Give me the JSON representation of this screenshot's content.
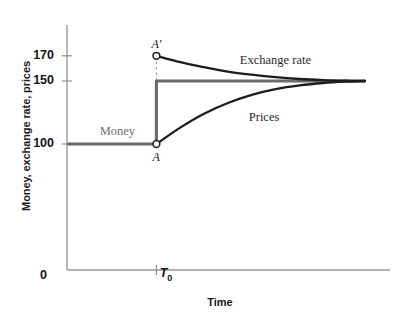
{
  "chart_data": {
    "type": "line",
    "title": "",
    "xlabel": "Time",
    "ylabel": "Money, exchange rate, prices",
    "ylim": [
      0,
      190
    ],
    "xlim": [
      0,
      100
    ],
    "grid": false,
    "legend_position": "inline-annotations",
    "yticks": [
      {
        "value": 170,
        "label": "170"
      },
      {
        "value": 150,
        "label": "150"
      },
      {
        "value": 100,
        "label": "100"
      }
    ],
    "xticks": [
      {
        "value": 0,
        "label": "0"
      },
      {
        "value": 30,
        "label": "T",
        "sublabel": "0"
      }
    ],
    "series": [
      {
        "name": "Money",
        "color": "#6b6b6b",
        "label_text": "Money",
        "description": "Money supply is flat at 100 until T0, then jumps permanently to 150",
        "points": [
          {
            "x": 0,
            "y": 100
          },
          {
            "x": 30,
            "y": 100
          },
          {
            "x": 30,
            "y": 150
          },
          {
            "x": 100,
            "y": 150
          }
        ]
      },
      {
        "name": "Exchange rate",
        "color": "#1c1c1c",
        "label_text": "Exchange rate",
        "description": "Overshoots to 170 at T0 then decays asymptotically down to 150",
        "points": [
          {
            "x": 30,
            "y": 170
          },
          {
            "x": 38,
            "y": 165
          },
          {
            "x": 46,
            "y": 161
          },
          {
            "x": 54,
            "y": 157.5
          },
          {
            "x": 62,
            "y": 155
          },
          {
            "x": 70,
            "y": 153
          },
          {
            "x": 78,
            "y": 151.6
          },
          {
            "x": 86,
            "y": 150.7
          },
          {
            "x": 94,
            "y": 150.2
          },
          {
            "x": 100,
            "y": 150
          }
        ]
      },
      {
        "name": "Prices",
        "color": "#1c1c1c",
        "label_text": "Prices",
        "description": "Sticky at 100 at T0 then rises asymptotically up to 150",
        "points": [
          {
            "x": 30,
            "y": 100
          },
          {
            "x": 38,
            "y": 113
          },
          {
            "x": 46,
            "y": 124
          },
          {
            "x": 54,
            "y": 132.5
          },
          {
            "x": 62,
            "y": 139
          },
          {
            "x": 70,
            "y": 143.5
          },
          {
            "x": 78,
            "y": 146.5
          },
          {
            "x": 86,
            "y": 148.4
          },
          {
            "x": 94,
            "y": 149.5
          },
          {
            "x": 100,
            "y": 150
          }
        ]
      }
    ],
    "annotations": [
      {
        "name": "point-a",
        "text": "A",
        "x": 30,
        "y": 100,
        "marker": "open-circle"
      },
      {
        "name": "point-a-prime",
        "text": "A'",
        "x": 30,
        "y": 170,
        "marker": "open-circle"
      }
    ],
    "guides": [
      {
        "name": "overshoot-dashed-guide",
        "from": {
          "x": 30,
          "y": 170
        },
        "to": {
          "x": 30,
          "y": 150
        },
        "style": "dashed"
      }
    ]
  }
}
